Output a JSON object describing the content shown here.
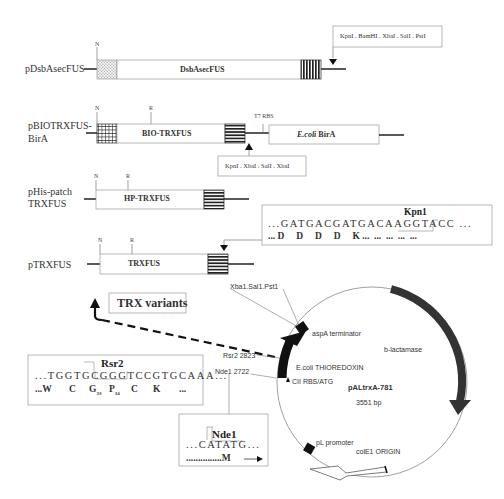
{
  "constructs": [
    {
      "name": "pDsbAsecFUS",
      "gene_label": "DsbAsecFUS",
      "markers": [
        "N"
      ],
      "sites_box": "KpnI . BamHI . XbaI . SalI . PstI"
    },
    {
      "name_line1": "pBIOTRXFUS-",
      "name_line2": "BirA",
      "gene_label": "BIO-TRXFUS",
      "markers": [
        "N",
        "R"
      ],
      "rbs_label": "T7 RBS",
      "second_gene_prefix": "E.coli",
      "second_gene_suffix": "BirA",
      "sites_box": "KpnI . XbaI . SalI . XbaI"
    },
    {
      "name_line1": "pHis-patch",
      "name_line2": "TRXFUS",
      "gene_label": "HP-TRXFUS",
      "markers": [
        "N",
        "R"
      ]
    },
    {
      "name": "pTRXFUS",
      "gene_label": "TRXFUS",
      "markers": [
        "N",
        "R"
      ]
    }
  ],
  "kpn_box": {
    "enzyme": "Kpn1",
    "dna": "...GATGACGATGACAAGGTACC ...",
    "protein": "... D     D     D     D     K ...  ...  ...  ...  ..."
  },
  "rsr_box": {
    "enzyme": "Rsr2",
    "dna": "...TGGTGCGGGTCCGTGCAAA...",
    "protein_parts": [
      "...W",
      "C",
      "G",
      "33",
      "P",
      "34",
      "C",
      "K",
      "..."
    ]
  },
  "nde_box": {
    "enzyme": "Nde1",
    "dna": "...CATATG...",
    "protein": "...............M"
  },
  "trx_variants_label": "TRX variants",
  "plasmid_map": {
    "name": "pALtrxA-781",
    "size": "3551 bp",
    "features": {
      "mcs": "Xba1.Sal1.Pst1",
      "terminator": "aspA terminator",
      "bla": "b-lactamase",
      "thioredoxin": "E.coli THIOREDOXIN",
      "rbs": "CII RBS/ATG",
      "promoter": "pL promoter",
      "origin": "colE1 ORIGIN"
    },
    "sites": {
      "rsr2": "Rsr2 2823",
      "nde1": "Nde1 2722"
    }
  }
}
